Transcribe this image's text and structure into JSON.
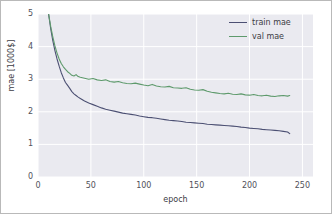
{
  "chart_data": {
    "type": "line",
    "title": "",
    "xlabel": "epoch",
    "ylabel": "mae [1000$]",
    "xlim": [
      0,
      260
    ],
    "ylim": [
      0,
      5
    ],
    "grid": true,
    "legend_position": "top-right",
    "xticks": [
      "0",
      "50",
      "100",
      "150",
      "200",
      "250"
    ],
    "xtick_values": [
      0,
      50,
      100,
      150,
      200,
      250
    ],
    "yticks": [
      "0",
      "1",
      "2",
      "3",
      "4",
      "5"
    ],
    "ytick_values": [
      0,
      1,
      2,
      3,
      4,
      5
    ],
    "series": [
      {
        "name": "train mae",
        "color": "#4c5073",
        "x": [
          10,
          12,
          14,
          16,
          18,
          20,
          22,
          24,
          26,
          28,
          30,
          32,
          34,
          36,
          38,
          40,
          44,
          48,
          52,
          56,
          60,
          64,
          68,
          72,
          76,
          80,
          84,
          88,
          92,
          96,
          100,
          104,
          108,
          112,
          116,
          120,
          124,
          128,
          132,
          136,
          140,
          144,
          148,
          152,
          156,
          160,
          164,
          168,
          172,
          176,
          180,
          184,
          188,
          192,
          196,
          200,
          204,
          208,
          212,
          216,
          220,
          224,
          228,
          232,
          236,
          238
        ],
        "values": [
          5.0,
          4.55,
          4.18,
          3.88,
          3.62,
          3.4,
          3.2,
          3.04,
          2.9,
          2.81,
          2.72,
          2.62,
          2.55,
          2.5,
          2.45,
          2.41,
          2.33,
          2.27,
          2.22,
          2.17,
          2.12,
          2.08,
          2.05,
          2.02,
          1.99,
          1.96,
          1.94,
          1.92,
          1.9,
          1.87,
          1.85,
          1.83,
          1.82,
          1.8,
          1.78,
          1.76,
          1.74,
          1.73,
          1.72,
          1.7,
          1.68,
          1.67,
          1.66,
          1.65,
          1.64,
          1.62,
          1.61,
          1.6,
          1.59,
          1.58,
          1.57,
          1.56,
          1.55,
          1.53,
          1.52,
          1.5,
          1.49,
          1.48,
          1.46,
          1.45,
          1.44,
          1.43,
          1.42,
          1.4,
          1.38,
          1.33
        ]
      },
      {
        "name": "val mae",
        "color": "#5e9a6c",
        "x": [
          10,
          12,
          14,
          16,
          18,
          20,
          22,
          24,
          26,
          28,
          30,
          32,
          34,
          36,
          38,
          40,
          44,
          48,
          52,
          56,
          60,
          64,
          68,
          72,
          76,
          80,
          84,
          88,
          92,
          96,
          100,
          104,
          108,
          112,
          116,
          120,
          124,
          128,
          132,
          136,
          140,
          144,
          148,
          152,
          156,
          160,
          164,
          168,
          172,
          176,
          180,
          184,
          188,
          192,
          196,
          200,
          204,
          208,
          212,
          216,
          220,
          224,
          228,
          232,
          236,
          238
        ],
        "values": [
          5.0,
          4.62,
          4.3,
          4.02,
          3.8,
          3.62,
          3.48,
          3.38,
          3.3,
          3.23,
          3.18,
          3.12,
          3.1,
          3.14,
          3.08,
          3.06,
          3.03,
          3.0,
          3.02,
          2.98,
          2.96,
          2.98,
          2.93,
          2.91,
          2.93,
          2.89,
          2.87,
          2.86,
          2.88,
          2.85,
          2.82,
          2.8,
          2.84,
          2.79,
          2.77,
          2.76,
          2.78,
          2.74,
          2.73,
          2.72,
          2.74,
          2.69,
          2.67,
          2.66,
          2.68,
          2.63,
          2.6,
          2.58,
          2.56,
          2.55,
          2.57,
          2.54,
          2.53,
          2.55,
          2.52,
          2.51,
          2.53,
          2.5,
          2.49,
          2.51,
          2.48,
          2.47,
          2.49,
          2.5,
          2.48,
          2.5
        ]
      }
    ]
  },
  "legend": {
    "items": [
      {
        "label": "train mae",
        "color": "#4c5073"
      },
      {
        "label": "val mae",
        "color": "#5e9a6c"
      }
    ]
  }
}
